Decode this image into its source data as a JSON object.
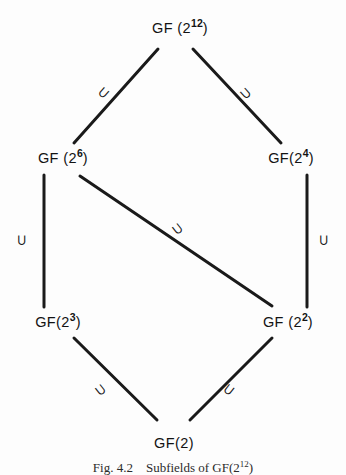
{
  "figure": {
    "caption_prefix": "Fig. 4.2",
    "caption_text": "Subfields of GF(2",
    "caption_exponent": "12",
    "caption_suffix": ")"
  },
  "diagram": {
    "type": "hasse-lattice",
    "nodes": [
      {
        "id": "gf2_12",
        "base": "GF (2",
        "exponent": "12",
        "close": ")",
        "x": 180,
        "y": 28
      },
      {
        "id": "gf2_6",
        "base": "GF (2",
        "exponent": "6",
        "close": ")",
        "x": 63,
        "y": 158
      },
      {
        "id": "gf2_4",
        "base": "GF(2",
        "exponent": "4",
        "close": ")",
        "x": 291,
        "y": 158
      },
      {
        "id": "gf2_3",
        "base": "GF(2",
        "exponent": "3",
        "close": ")",
        "x": 58,
        "y": 322
      },
      {
        "id": "gf2_2",
        "base": "GF (2",
        "exponent": "2",
        "close": ")",
        "x": 288,
        "y": 322
      },
      {
        "id": "gf2",
        "base": "GF(2)",
        "exponent": "",
        "close": "",
        "x": 174,
        "y": 443
      }
    ],
    "edges": [
      {
        "id": "e-12-6",
        "from": "gf2_12",
        "to": "gf2_6",
        "x1": 158,
        "y1": 49,
        "x2": 74,
        "y2": 143
      },
      {
        "id": "e-12-4",
        "from": "gf2_12",
        "to": "gf2_4",
        "x1": 193,
        "y1": 49,
        "x2": 281,
        "y2": 143
      },
      {
        "id": "e-6-3",
        "from": "gf2_6",
        "to": "gf2_3",
        "x1": 44,
        "y1": 175,
        "x2": 44,
        "y2": 307
      },
      {
        "id": "e-4-2",
        "from": "gf2_4",
        "to": "gf2_2",
        "x1": 307,
        "y1": 175,
        "x2": 307,
        "y2": 307
      },
      {
        "id": "e-6-2",
        "from": "gf2_6",
        "to": "gf2_2",
        "x1": 80,
        "y1": 176,
        "x2": 272,
        "y2": 306
      },
      {
        "id": "e-3-2b",
        "from": "gf2_3",
        "to": "gf2",
        "x1": 74,
        "y1": 338,
        "x2": 157,
        "y2": 420
      },
      {
        "id": "e-2-2b",
        "from": "gf2_2",
        "to": "gf2",
        "x1": 272,
        "y1": 338,
        "x2": 190,
        "y2": 420
      }
    ],
    "edge_labels": [
      {
        "id": "lbl-12-6",
        "symbol": "⊃",
        "meaning": "superset",
        "x": 104,
        "y": 93,
        "rotation": 130
      },
      {
        "id": "lbl-12-4",
        "symbol": "⊃",
        "meaning": "superset",
        "x": 246,
        "y": 93,
        "rotation": 48
      },
      {
        "id": "lbl-6-3",
        "symbol": "⊃",
        "meaning": "superset",
        "x": 22,
        "y": 240,
        "rotation": 90
      },
      {
        "id": "lbl-4-2",
        "symbol": "⊃",
        "meaning": "superset",
        "x": 324,
        "y": 240,
        "rotation": 90
      },
      {
        "id": "lbl-6-2",
        "symbol": "⊃",
        "meaning": "superset",
        "x": 178,
        "y": 229,
        "rotation": 52
      },
      {
        "id": "lbl-3-2b",
        "symbol": "⊃",
        "meaning": "superset",
        "x": 101,
        "y": 390,
        "rotation": 52
      },
      {
        "id": "lbl-2-2b",
        "symbol": "⊃",
        "meaning": "superset",
        "x": 229,
        "y": 390,
        "rotation": 128
      }
    ],
    "style": {
      "line_color": "#1a1a1a",
      "line_width": 3,
      "text_color": "#131313",
      "background": "#fdfdfd"
    }
  }
}
